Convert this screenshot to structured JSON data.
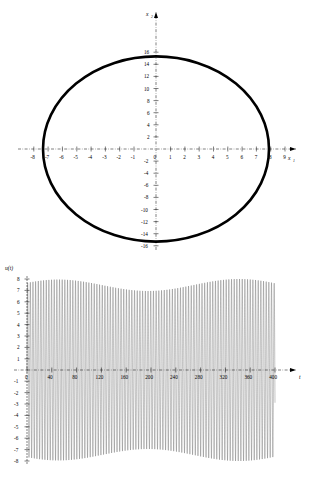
{
  "figure": {
    "background_color": "#ffffff",
    "ink_color": "#000000"
  },
  "chart_data": [
    {
      "id": "phase-portrait",
      "type": "line",
      "title": "",
      "subtitle": "",
      "xlabel": "x_1",
      "ylabel": "x_2",
      "xlabel_display": "x",
      "xlabel_sub": "1",
      "ylabel_display": "x",
      "ylabel_sub": "2",
      "xlim": [
        -9.3,
        10.2
      ],
      "ylim": [
        -17.2,
        17.2
      ],
      "grid": false,
      "axes_style": "dash-dot crossed axes with arrows",
      "xticks": [
        -8,
        -7,
        -6,
        -5,
        -4,
        -3,
        -2,
        -1,
        0,
        1,
        2,
        3,
        4,
        5,
        6,
        7,
        8,
        9
      ],
      "xticklabels": [
        "-8",
        "-7",
        "-6",
        "-5",
        "-4",
        "-3",
        "-2",
        "-1",
        "0",
        "1",
        "2",
        "3",
        "4",
        "5",
        "6",
        "7",
        "8",
        "9"
      ],
      "yticks": [
        -16,
        -14,
        -12,
        -10,
        -8,
        -6,
        -4,
        -2,
        2,
        4,
        6,
        8,
        10,
        12,
        14,
        16
      ],
      "yticklabels": [
        "-16",
        "-14",
        "-12",
        "-10",
        "-8",
        "-6",
        "-4",
        "-2",
        "2",
        "4",
        "6",
        "8",
        "10",
        "12",
        "14",
        "16"
      ],
      "series": [
        {
          "name": "limit cycle",
          "description": "closed orbit (limit cycle) traced as a thick black near-circular loop",
          "center": [
            0.0,
            0.0
          ],
          "radius_x": 7.9,
          "radius_y": 15.3,
          "stroke_width": 2.6,
          "closed": true
        }
      ],
      "legend": "none"
    },
    {
      "id": "time-series",
      "type": "line",
      "title": "",
      "subtitle": "",
      "xlabel": "t",
      "ylabel": "u(t)",
      "xlim": [
        -12,
        432
      ],
      "ylim": [
        -8.6,
        8.6
      ],
      "grid": false,
      "axes_style": "dash-dot horizontal axis with arrow, plain vertical axis",
      "xticks": [
        0,
        40,
        80,
        120,
        160,
        200,
        240,
        280,
        320,
        360,
        400
      ],
      "xticklabels": [
        "0",
        "40",
        "80",
        "120",
        "160",
        "200",
        "240",
        "280",
        "320",
        "360",
        "400"
      ],
      "yticks": [
        -8,
        -7,
        -6,
        -5,
        -4,
        -3,
        -2,
        -1,
        1,
        2,
        3,
        4,
        5,
        6,
        7,
        8
      ],
      "yticklabels": [
        "-8",
        "-7",
        "-6",
        "-5",
        "-4",
        "-3",
        "-2",
        "-1",
        "1",
        "2",
        "3",
        "4",
        "5",
        "6",
        "7",
        "8"
      ],
      "series": [
        {
          "name": "u(t)",
          "description": "high-frequency oscillation filling the band from about -8 to +8 over t = 0 to 400",
          "amplitude": 7.9,
          "t_start": 0,
          "t_end": 400,
          "envelope_min": -8.0,
          "envelope_max": 8.0,
          "stroke_width": 0.28
        }
      ],
      "legend": "none"
    }
  ]
}
